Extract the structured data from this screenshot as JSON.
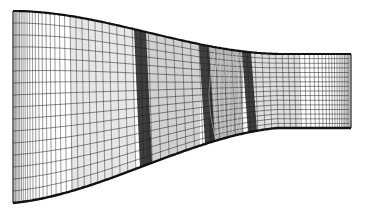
{
  "figure": {
    "title": "",
    "background_color": "#ffffff",
    "line_color": "#1a1a1a",
    "boundary_color": "#111111",
    "shading_color": "#7a7a7a"
  },
  "mesh": {
    "streamwise_lines": 70,
    "spanwise_lines": 16,
    "blade_rows": [
      {
        "name": "row-1",
        "dense": true
      },
      {
        "name": "row-2",
        "dense": true
      },
      {
        "name": "row-3",
        "dense": true
      }
    ]
  }
}
